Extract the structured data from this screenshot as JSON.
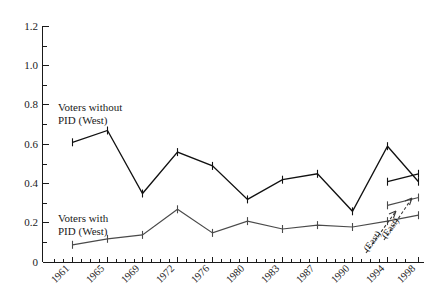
{
  "chart_data": {
    "type": "line",
    "title": "",
    "subtitle": "",
    "xlabel": "",
    "ylabel": "",
    "grid": false,
    "legend_position": "inline-annotations",
    "x": [
      "1961",
      "1965",
      "1969",
      "1972",
      "1976",
      "1980",
      "1983",
      "1987",
      "1990",
      "1994",
      "1998"
    ],
    "xtick_labels": [
      "1961",
      "1965",
      "1969",
      "1972",
      "1976",
      "1980",
      "1983",
      "1987",
      "1990",
      "1994",
      "1998"
    ],
    "ytick_labels": [
      "0",
      "0.2",
      "0.4",
      "0.6",
      "0.8",
      "1.0",
      "1.2"
    ],
    "ytick_values": [
      0,
      0.2,
      0.4,
      0.6,
      0.8,
      1.0,
      1.2
    ],
    "yminor_values": [
      0.1,
      0.3,
      0.5,
      0.7,
      0.9,
      1.1
    ],
    "ylim": [
      0,
      1.2
    ],
    "series": [
      {
        "name": "Voters without PID (West)",
        "label_line1": "Voters without",
        "label_line2": "PID (West)",
        "color": "#111111",
        "values": [
          0.61,
          0.67,
          0.35,
          0.56,
          0.49,
          0.32,
          0.42,
          0.45,
          0.26,
          0.59,
          0.41
        ]
      },
      {
        "name": "Voters with PID (West)",
        "label_line1": "Voters with",
        "label_line2": "PID (West)",
        "color": "#4a4a4a",
        "values": [
          0.09,
          0.12,
          0.14,
          0.27,
          0.15,
          0.21,
          0.17,
          0.19,
          0.18,
          0.21,
          0.24
        ]
      },
      {
        "name": "Voters without PID (East)",
        "color": "#111111",
        "x": [
          "1994",
          "1998"
        ],
        "values": [
          0.41,
          0.45
        ]
      },
      {
        "name": "Voters with PID (East)",
        "color": "#4a4a4a",
        "x": [
          "1994",
          "1998"
        ],
        "values": [
          0.29,
          0.33
        ]
      }
    ],
    "annotations": [
      {
        "text": "Voters without",
        "role": "series-label-line",
        "x": "1965",
        "y": 0.78
      },
      {
        "text": "PID (West)",
        "role": "series-label-line",
        "x": "1965",
        "y": 0.72
      },
      {
        "text": "Voters with",
        "role": "series-label-line",
        "x": "1965",
        "y": 0.245
      },
      {
        "text": "PID (West)",
        "role": "series-label-line",
        "x": "1965",
        "y": 0.19
      },
      {
        "text": "(East)",
        "role": "callout-rotated",
        "target": "with-pid-east"
      },
      {
        "text": "(East)",
        "role": "callout-rotated",
        "target": "without-pid-east"
      }
    ]
  },
  "axis": {
    "y_labels": [
      "1.2",
      "1.0",
      "0.8",
      "0.6",
      "0.4",
      "0.2",
      "0"
    ],
    "x_labels": [
      "1961",
      "1965",
      "1969",
      "1972",
      "1976",
      "1980",
      "1983",
      "1987",
      "1990",
      "1994",
      "1998"
    ]
  },
  "labels": {
    "without_pid_west_l1": "Voters without",
    "without_pid_west_l2": "PID (West)",
    "with_pid_west_l1": "Voters with",
    "with_pid_west_l2": "PID (West)",
    "east_callout_lower": "(East)",
    "east_callout_upper": "(East)"
  },
  "colors": {
    "background": "#ffffff",
    "axis": "#1a1a1a",
    "series_without_pid": "#111111",
    "series_with_pid": "#4a4a4a",
    "callout": "#3a3a3a"
  }
}
